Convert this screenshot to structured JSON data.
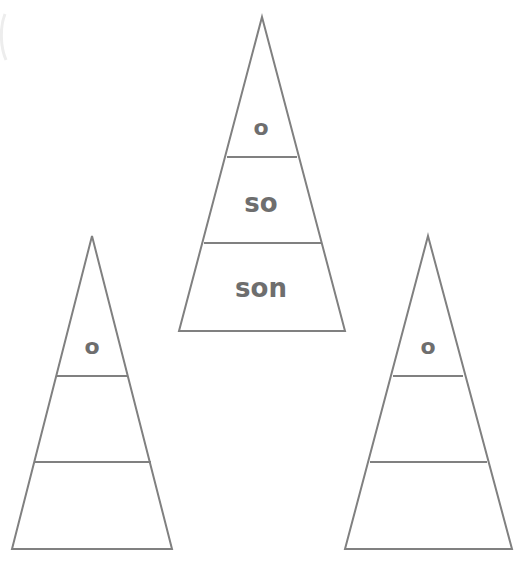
{
  "page": {
    "background_color": "#ffffff",
    "stroke_color": "#808080",
    "text_color": "#6e6e6e",
    "width": 529,
    "height": 571
  },
  "pyramids": [
    {
      "id": "left",
      "name": "left-pyramid",
      "apex": {
        "x": 92,
        "y": 236
      },
      "base": {
        "y": 549,
        "left_x": 12,
        "right_x": 172
      },
      "dividers_y": [
        376,
        462
      ],
      "clipped_edge": "left",
      "bands": [
        {
          "index": 0,
          "position": "top",
          "label": "o"
        },
        {
          "index": 1,
          "position": "middle",
          "label": ""
        },
        {
          "index": 2,
          "position": "bottom",
          "label": ""
        }
      ]
    },
    {
      "id": "middle",
      "name": "middle-pyramid",
      "apex": {
        "x": 262,
        "y": 17
      },
      "base": {
        "y": 331,
        "left_x": 179,
        "right_x": 345
      },
      "dividers_y": [
        157,
        243
      ],
      "clipped_edge": "none",
      "bands": [
        {
          "index": 0,
          "position": "top",
          "label": "o"
        },
        {
          "index": 1,
          "position": "middle",
          "label": "so"
        },
        {
          "index": 2,
          "position": "bottom",
          "label": "son"
        }
      ]
    },
    {
      "id": "right",
      "name": "right-pyramid",
      "apex": {
        "x": 428,
        "y": 236
      },
      "base": {
        "y": 549,
        "left_x": 345,
        "right_x": 512
      },
      "dividers_y": [
        376,
        462
      ],
      "clipped_edge": "none",
      "bands": [
        {
          "index": 0,
          "position": "top",
          "label": "o"
        },
        {
          "index": 1,
          "position": "middle",
          "label": ""
        },
        {
          "index": 2,
          "position": "bottom",
          "label": ""
        }
      ]
    }
  ],
  "label_font_sizes": {
    "small": 22,
    "large": 26
  }
}
